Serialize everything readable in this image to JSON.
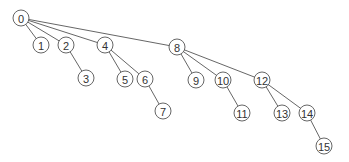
{
  "diagram": {
    "type": "tree",
    "node_radius": 8,
    "colors": {
      "stroke": "#555555",
      "fill": "#ffffff",
      "text": "#333333"
    },
    "nodes": [
      {
        "id": "0",
        "label": "0",
        "x": 21,
        "y": 18
      },
      {
        "id": "1",
        "label": "1",
        "x": 41,
        "y": 45
      },
      {
        "id": "2",
        "label": "2",
        "x": 66,
        "y": 45
      },
      {
        "id": "3",
        "label": "3",
        "x": 86,
        "y": 78
      },
      {
        "id": "4",
        "label": "4",
        "x": 105,
        "y": 45
      },
      {
        "id": "5",
        "label": "5",
        "x": 125,
        "y": 79
      },
      {
        "id": "6",
        "label": "6",
        "x": 145,
        "y": 79
      },
      {
        "id": "7",
        "label": "7",
        "x": 163,
        "y": 111
      },
      {
        "id": "8",
        "label": "8",
        "x": 177,
        "y": 47
      },
      {
        "id": "9",
        "label": "9",
        "x": 196,
        "y": 80
      },
      {
        "id": "10",
        "label": "10",
        "x": 223,
        "y": 80
      },
      {
        "id": "11",
        "label": "11",
        "x": 242,
        "y": 113
      },
      {
        "id": "12",
        "label": "12",
        "x": 262,
        "y": 80
      },
      {
        "id": "13",
        "label": "13",
        "x": 282,
        "y": 113
      },
      {
        "id": "14",
        "label": "14",
        "x": 307,
        "y": 113
      },
      {
        "id": "15",
        "label": "15",
        "x": 324,
        "y": 146
      }
    ],
    "edges": [
      [
        "0",
        "1"
      ],
      [
        "0",
        "2"
      ],
      [
        "0",
        "4"
      ],
      [
        "0",
        "8"
      ],
      [
        "2",
        "3"
      ],
      [
        "4",
        "5"
      ],
      [
        "4",
        "6"
      ],
      [
        "6",
        "7"
      ],
      [
        "8",
        "9"
      ],
      [
        "8",
        "10"
      ],
      [
        "8",
        "12"
      ],
      [
        "10",
        "11"
      ],
      [
        "12",
        "13"
      ],
      [
        "12",
        "14"
      ],
      [
        "14",
        "15"
      ]
    ]
  }
}
